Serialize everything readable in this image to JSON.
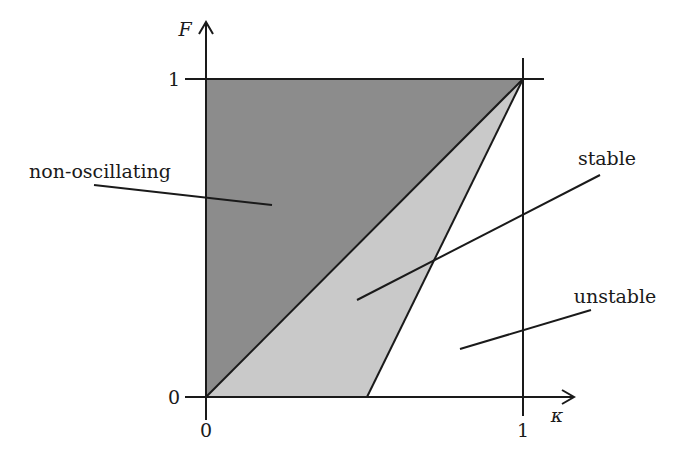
{
  "diagram": {
    "type": "stability-region-diagram",
    "axes": {
      "x": {
        "label": "κ",
        "ticks": [
          {
            "value": 0,
            "label": "0"
          },
          {
            "value": 1,
            "label": "1"
          }
        ]
      },
      "y": {
        "label": "F",
        "ticks": [
          {
            "value": 0,
            "label": "0"
          },
          {
            "value": 1,
            "label": "1"
          }
        ]
      }
    },
    "regions": [
      {
        "name": "non-oscillating",
        "label": "non-oscillating",
        "fill": "#8c8c8c",
        "vertices": [
          [
            0,
            0
          ],
          [
            0,
            1
          ],
          [
            1,
            1
          ]
        ]
      },
      {
        "name": "stable",
        "label": "stable",
        "fill": "#c9c9c9",
        "vertices": [
          [
            0,
            0
          ],
          [
            1,
            1
          ],
          [
            0.5,
            0
          ]
        ]
      },
      {
        "name": "unstable",
        "label": "unstable",
        "fill": "#ffffff",
        "vertices": [
          [
            0.5,
            0
          ],
          [
            1,
            1
          ],
          [
            1,
            0
          ]
        ]
      }
    ],
    "boundary_lines": [
      {
        "from": [
          0,
          0
        ],
        "to": [
          1,
          1
        ]
      },
      {
        "from": [
          0.5,
          0
        ],
        "to": [
          1,
          1
        ]
      }
    ],
    "colors": {
      "ink": "#1a1a1a",
      "dark_region": "#8c8c8c",
      "light_region": "#c9c9c9"
    }
  }
}
